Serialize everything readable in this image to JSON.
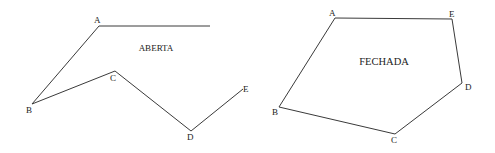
{
  "figures": {
    "open": {
      "title": "ABERTA",
      "title_pos": [
        156,
        51
      ],
      "polyline": [
        [
          210,
          26
        ],
        [
          99,
          26
        ],
        [
          32,
          104
        ],
        [
          115,
          71
        ],
        [
          191,
          131
        ],
        [
          243,
          89
        ]
      ],
      "vertices": [
        {
          "label": "A",
          "x": 94,
          "y": 23
        },
        {
          "label": "B",
          "x": 26,
          "y": 113
        },
        {
          "label": "C",
          "x": 110,
          "y": 81
        },
        {
          "label": "D",
          "x": 187,
          "y": 140
        },
        {
          "label": "E",
          "x": 243,
          "y": 92
        }
      ]
    },
    "closed": {
      "title": "FECHADA",
      "title_pos": [
        384,
        65
      ],
      "polygon": [
        [
          335,
          18
        ],
        [
          452,
          19
        ],
        [
          462,
          83
        ],
        [
          395,
          134
        ],
        [
          279,
          107
        ]
      ],
      "vertices": [
        {
          "label": "A",
          "x": 329,
          "y": 16
        },
        {
          "label": "E",
          "x": 449,
          "y": 17
        },
        {
          "label": "D",
          "x": 465,
          "y": 90
        },
        {
          "label": "C",
          "x": 391,
          "y": 143
        },
        {
          "label": "B",
          "x": 272,
          "y": 115
        }
      ]
    }
  },
  "colors": {
    "line": "#3a3a3a",
    "text": "#222222",
    "background": "#ffffff"
  }
}
